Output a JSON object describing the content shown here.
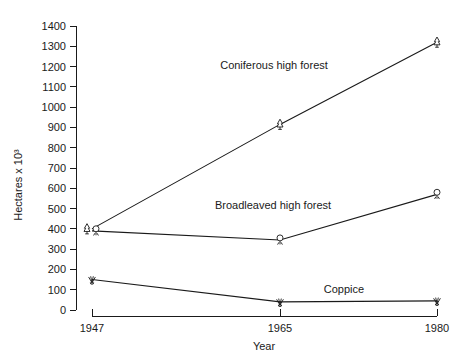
{
  "chart_data": {
    "type": "line",
    "title": "",
    "subtitle": "",
    "xlabel": "Year",
    "ylabel": "Hectares x 10³",
    "x": [
      1947,
      1965,
      1980
    ],
    "categories": [
      "1947",
      "1965",
      "1980"
    ],
    "xtick_labels": [
      "1947",
      "1965",
      "1980"
    ],
    "ytick_labels": [
      "0",
      "100",
      "200",
      "300",
      "400",
      "500",
      "600",
      "700",
      "800",
      "900",
      "1000",
      "1100",
      "1200",
      "1300",
      "1400"
    ],
    "ylim": [
      0,
      1400
    ],
    "ytick_step": 100,
    "xlim": [
      1947,
      1980
    ],
    "grid": false,
    "legend": "inline-annotations",
    "legend_position": "none",
    "series": [
      {
        "name": "Coniferous high forest",
        "marker": "conifer-tree-icon",
        "values": [
          400,
          915,
          1320
        ],
        "annotation": "Coniferous high forest"
      },
      {
        "name": "Broadleaved high forest",
        "marker": "broadleaf-tree-icon",
        "values": [
          390,
          345,
          570
        ],
        "annotation": "Broadleaved high forest"
      },
      {
        "name": "Coppice",
        "marker": "coppice-shrub-icon",
        "values": [
          150,
          40,
          45
        ],
        "annotation": "Coppice"
      }
    ],
    "annotations": [
      {
        "text": "Coniferous high forest",
        "x_px": 274,
        "y_px": 69
      },
      {
        "text": "Broadleaved high forest",
        "x_px": 273,
        "y_px": 209
      },
      {
        "text": "Coppice",
        "x_px": 344,
        "y_px": 293
      }
    ],
    "colors": {
      "line": "#1a1a1a",
      "axis": "#1a1a1a",
      "text": "#1a1a1a",
      "background": "#ffffff",
      "marker_fill": "#ffffff"
    }
  },
  "axes": {
    "y_title": "Hectares x 10³",
    "x_title": "Year"
  }
}
